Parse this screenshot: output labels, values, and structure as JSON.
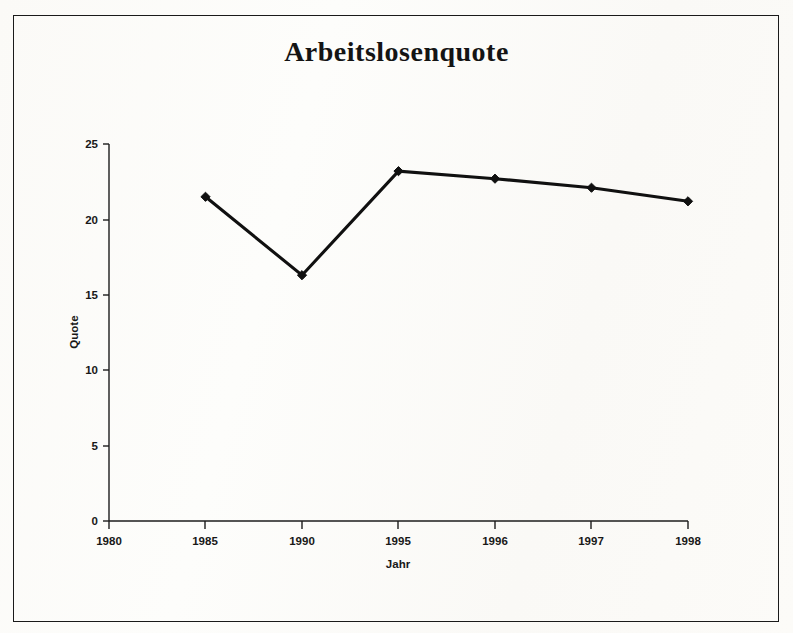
{
  "figure": {
    "title": "Arbeitslosenquote",
    "background_color": "#fdfcfa",
    "frame_color": "#1a1a1a",
    "series_color": "#101010"
  },
  "axes": {
    "x_title": "Jahr",
    "y_title": "Quote",
    "x_tick_labels": [
      "1980",
      "1985",
      "1990",
      "1995",
      "1996",
      "1997",
      "1998"
    ],
    "y_tick_labels": [
      "0",
      "5",
      "10",
      "15",
      "20",
      "25"
    ]
  },
  "chart_data": {
    "type": "line",
    "title": "Arbeitslosenquote",
    "subtitle": "",
    "xlabel": "Jahr",
    "ylabel": "Quote",
    "categories": [
      "1980",
      "1985",
      "1990",
      "1995",
      "1996",
      "1997",
      "1998"
    ],
    "values": [
      null,
      21.5,
      16.3,
      23.2,
      22.7,
      22.1,
      21.2
    ],
    "series": [
      {
        "name": "Arbeitslosenquote",
        "values": [
          null,
          21.5,
          16.3,
          23.2,
          22.7,
          22.1,
          21.2
        ],
        "color": "#101010",
        "marker": "diamond"
      }
    ],
    "ylim": [
      0,
      25
    ],
    "yticks": [
      0,
      5,
      10,
      15,
      20,
      25
    ],
    "xticks": [
      "1980",
      "1985",
      "1990",
      "1995",
      "1996",
      "1997",
      "1998"
    ],
    "grid": false,
    "legend": false
  }
}
